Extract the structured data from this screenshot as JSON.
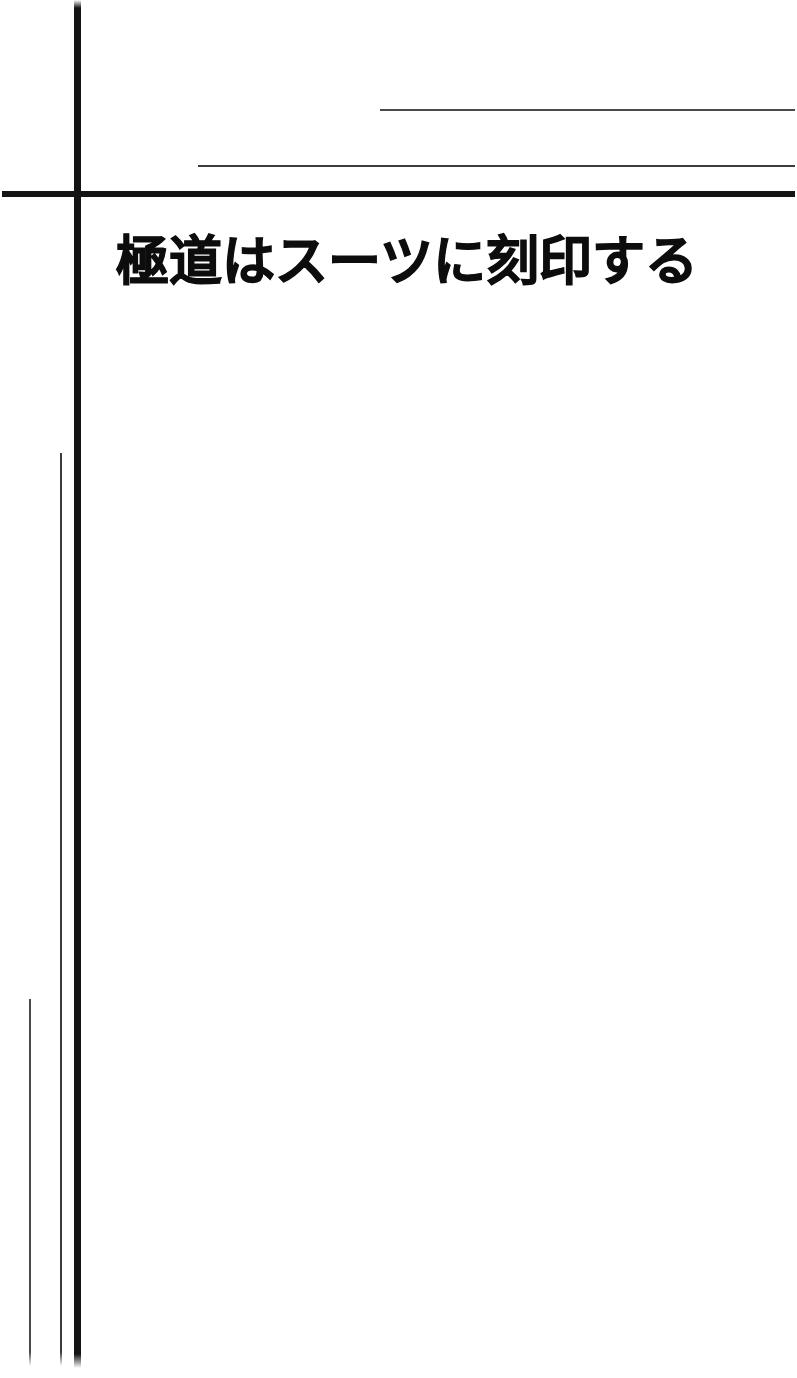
{
  "page": {
    "kind": "manga-title-page",
    "background_color": "#ffffff",
    "ink_color": "#141414",
    "width": 797,
    "height": 1378
  },
  "title": {
    "text": "極道はスーツに刻印する",
    "language": "ja"
  },
  "rules": {
    "horizontal_thick": {
      "name": "header-divider",
      "color": "#141414"
    },
    "horizontal_thin_upper": {
      "name": "upper-hairline",
      "color": "#4a4a4a"
    },
    "horizontal_thin_lower": {
      "name": "lower-hairline",
      "color": "#3c3c3c"
    },
    "vertical_thick": {
      "name": "gutter-rule",
      "color": "#141414"
    },
    "vertical_thin_inner": {
      "name": "inner-hairline",
      "color": "#3c3c3c"
    },
    "vertical_thin_outer": {
      "name": "outer-hairline",
      "color": "#4a4a4a"
    }
  },
  "body": {
    "content": ""
  }
}
